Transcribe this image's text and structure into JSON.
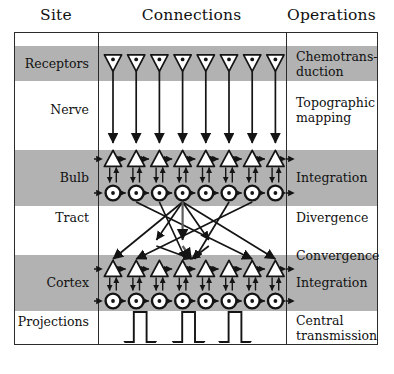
{
  "headers": {
    "site": "Site",
    "connections": "Connections",
    "operations": "Operations"
  },
  "rows": [
    {
      "site": "Receptors",
      "operation": "Chemotrans-\nduction",
      "shaded": true
    },
    {
      "site": "Nerve",
      "operation": "Topographic\nmapping",
      "shaded": false
    },
    {
      "site": "Bulb",
      "operation": "Integration",
      "shaded": true
    },
    {
      "site": "Tract",
      "operation": "Divergence",
      "shaded": false
    },
    {
      "site": "",
      "operation": "Convergence",
      "shaded": false
    },
    {
      "site": "Cortex",
      "operation": "Integration",
      "shaded": true
    },
    {
      "site": "Projections",
      "operation": "Central\ntransmission",
      "shaded": false
    }
  ],
  "site_labels": {
    "receptors": "Receptors",
    "nerve": "Nerve",
    "bulb": "Bulb",
    "tract": "Tract",
    "cortex": "Cortex",
    "projections": "Projections"
  },
  "operation_labels": {
    "chemotransduction_line1": "Chemotrans-",
    "chemotransduction_line2": "duction",
    "topographic_line1": "Topographic",
    "topographic_line2": "mapping",
    "integration_bulb": "Integration",
    "divergence": "Divergence",
    "convergence": "Convergence",
    "integration_cortex": "Integration",
    "central_line1": "Central",
    "central_line2": "transmission"
  },
  "colors": {
    "shaded_band": "#b2b2b2",
    "unshaded_band": "#ffffff",
    "frame_line": "#2b2b2b",
    "stroke": "#141414",
    "text": "#101010",
    "page_background": "#ffffff"
  },
  "diagram": {
    "receptor_count": 8,
    "bulb_triangle_count": 8,
    "bulb_circle_count": 8,
    "cortex_triangle_count": 8,
    "cortex_circle_count": 8,
    "projection_arrow_count": 3,
    "receptor_symbol": "down-triangle-with-dot",
    "neuron_symbol": "up-triangle-outline",
    "interneuron_symbol": "circle-with-dot",
    "lateral_connection": "dashed-double-arrow",
    "tract_pattern": "divergence-then-convergence",
    "projection_symbol": "hollow-block-arrow-down"
  }
}
